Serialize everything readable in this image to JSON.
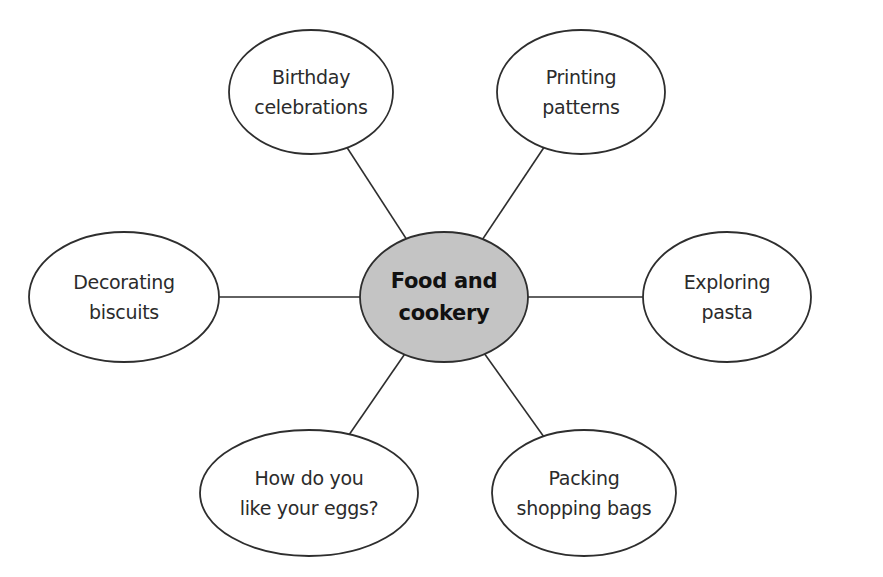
{
  "diagram": {
    "type": "mind-map",
    "colors": {
      "stroke": "#2e2e2e",
      "center_fill": "#c4c4c4",
      "node_fill": "#ffffff",
      "background": "#ffffff"
    },
    "center": {
      "line1": "Food and",
      "line2": "cookery",
      "cx": 444,
      "cy": 297,
      "rx": 84,
      "ry": 65
    },
    "nodes": [
      {
        "id": "birthday",
        "line1": "Birthday",
        "line2": "celebrations",
        "cx": 311,
        "cy": 92,
        "rx": 82,
        "ry": 62
      },
      {
        "id": "printing",
        "line1": "Printing",
        "line2": "patterns",
        "cx": 581,
        "cy": 92,
        "rx": 84,
        "ry": 62
      },
      {
        "id": "decorating",
        "line1": "Decorating",
        "line2": "biscuits",
        "cx": 124,
        "cy": 297,
        "rx": 95,
        "ry": 65
      },
      {
        "id": "exploring",
        "line1": "Exploring",
        "line2": "pasta",
        "cx": 727,
        "cy": 297,
        "rx": 84,
        "ry": 65
      },
      {
        "id": "eggs",
        "line1": "How do you",
        "line2": "like your eggs?",
        "cx": 309,
        "cy": 493,
        "rx": 109,
        "ry": 63
      },
      {
        "id": "packing",
        "line1": "Packing",
        "line2": "shopping bags",
        "cx": 584,
        "cy": 493,
        "rx": 92,
        "ry": 63
      }
    ]
  }
}
